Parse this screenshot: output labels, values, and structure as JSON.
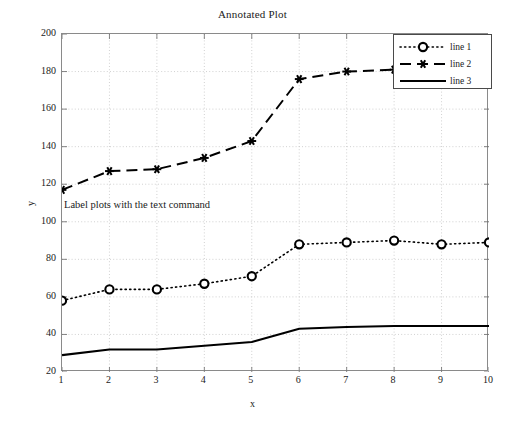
{
  "chart_data": {
    "type": "line",
    "title": "Annotated Plot",
    "xlabel": "x",
    "ylabel": "y",
    "xlim": [
      1,
      10
    ],
    "ylim": [
      20,
      200
    ],
    "xticks": [
      1,
      2,
      3,
      4,
      5,
      6,
      7,
      8,
      9,
      10
    ],
    "yticks": [
      20,
      40,
      60,
      80,
      100,
      120,
      140,
      160,
      180,
      200
    ],
    "grid": true,
    "legend_position": "upper right",
    "x": [
      1,
      2,
      3,
      4,
      5,
      6,
      7,
      8,
      9,
      10
    ],
    "series": [
      {
        "name": "line 1",
        "style": "dotted",
        "marker": "circle",
        "color": "#000000",
        "values": [
          58,
          64,
          64,
          67,
          71,
          88,
          89,
          90,
          88,
          89
        ]
      },
      {
        "name": "line 2",
        "style": "dashed",
        "marker": "asterisk",
        "color": "#000000",
        "values": [
          117,
          127,
          128,
          134,
          143,
          176,
          180,
          181,
          180,
          180
        ]
      },
      {
        "name": "line 3",
        "style": "solid",
        "marker": "none",
        "color": "#000000",
        "values": [
          29,
          32,
          32,
          34,
          36,
          43,
          44,
          44.5,
          44.5,
          44.5
        ]
      }
    ],
    "annotations": [
      {
        "text": "Label plots with the text command",
        "x": 1,
        "y": 114
      }
    ]
  },
  "legend": {
    "entries": [
      {
        "label": "line 1"
      },
      {
        "label": "line 2"
      },
      {
        "label": "line 3"
      }
    ]
  },
  "axis_ticks": {
    "y": [
      "200",
      "180",
      "160",
      "140",
      "120",
      "100",
      "80",
      "60",
      "40",
      "20"
    ],
    "x": [
      "1",
      "2",
      "3",
      "4",
      "5",
      "6",
      "7",
      "8",
      "9",
      "10"
    ]
  }
}
